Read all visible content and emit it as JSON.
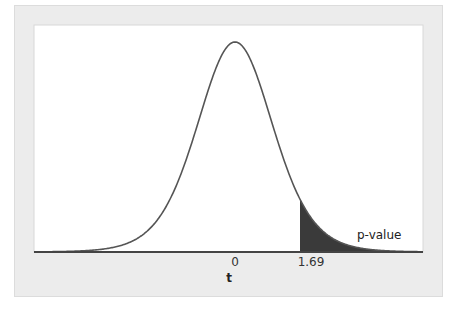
{
  "chart_data": {
    "type": "area",
    "title": "",
    "distribution": "t",
    "df": 10,
    "t_observed": 1.69,
    "x_range": [
      -5.2,
      4.9
    ],
    "xlabel": "t",
    "ylabel": "",
    "x_ticks": [
      {
        "value": 0,
        "label": "0"
      },
      {
        "value": 1.69,
        "label": "1.69"
      }
    ],
    "shaded_region": {
      "from": 1.69,
      "to": 4.9,
      "label": "p-value",
      "tail": "right"
    },
    "grid": false,
    "legend": null,
    "colors": {
      "curve": "#555555",
      "shade": "#3a3a3a",
      "plot_bg": "#ffffff",
      "panel_bg": "#ececec"
    }
  },
  "labels": {
    "xlabel": "t",
    "tick_0": "0",
    "tick_1": "1.69",
    "annotation": "p-value"
  }
}
